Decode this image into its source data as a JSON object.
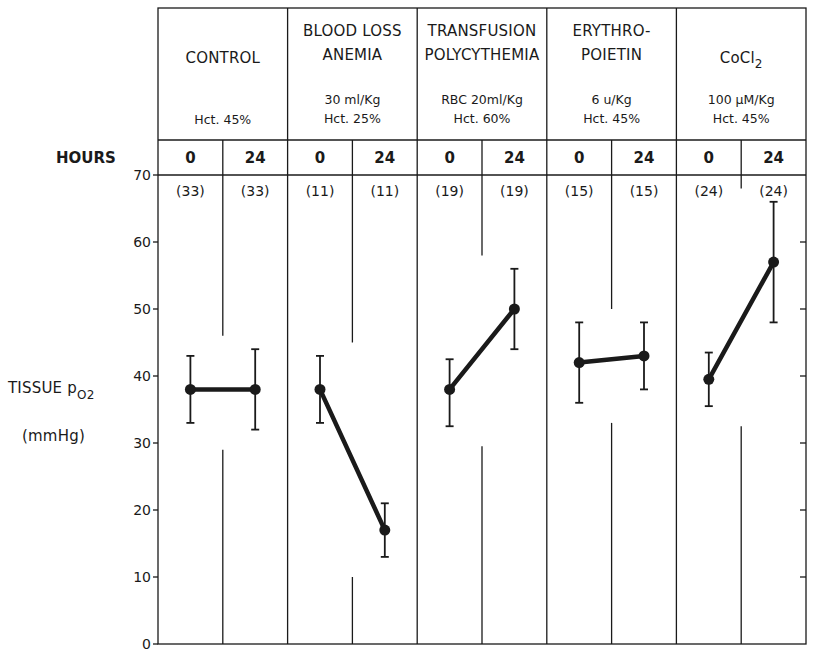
{
  "chart_data": {
    "type": "line",
    "title": "",
    "xlabel": "HOURS",
    "ylabel": "TISSUE pO2 (mmHg)",
    "ylabel_parts": {
      "main": "TISSUE p",
      "subscript": "O2",
      "unit": "(mmHg)"
    },
    "ylim": [
      0,
      70
    ],
    "yticks": [
      0,
      10,
      20,
      30,
      40,
      50,
      60,
      70
    ],
    "grid": false,
    "legend": "none",
    "hours_label": "HOURS",
    "groups": [
      {
        "name": "CONTROL",
        "name_lines": [
          "CONTROL"
        ],
        "detail_lines": [
          "Hct. 45%"
        ],
        "hours": [
          "0",
          "24"
        ],
        "n": [
          "(33)",
          "(33)"
        ],
        "mean": [
          38,
          38
        ],
        "err_low": [
          33,
          32
        ],
        "err_high": [
          43,
          44
        ]
      },
      {
        "name": "BLOOD LOSS ANEMIA",
        "name_lines": [
          "BLOOD LOSS",
          "ANEMIA"
        ],
        "detail_lines": [
          "30 ml/Kg",
          "Hct. 25%"
        ],
        "hours": [
          "0",
          "24"
        ],
        "n": [
          "(11)",
          "(11)"
        ],
        "mean": [
          38,
          17
        ],
        "err_low": [
          33,
          13
        ],
        "err_high": [
          43,
          21
        ]
      },
      {
        "name": "TRANSFUSION POLYCYTHEMIA",
        "name_lines": [
          "TRANSFUSION",
          "POLYCYTHEMIA"
        ],
        "detail_lines": [
          "RBC 20ml/Kg",
          "Hct. 60%"
        ],
        "hours": [
          "0",
          "24"
        ],
        "n": [
          "(19)",
          "(19)"
        ],
        "mean": [
          38,
          50
        ],
        "err_low": [
          32.5,
          44
        ],
        "err_high": [
          42.5,
          56
        ]
      },
      {
        "name": "ERYTHROPOIETIN",
        "name_lines": [
          "ERYTHRO-",
          "POIETIN"
        ],
        "detail_lines": [
          "6 u/Kg",
          "Hct. 45%"
        ],
        "hours": [
          "0",
          "24"
        ],
        "n": [
          "(15)",
          "(15)"
        ],
        "mean": [
          42,
          43
        ],
        "err_low": [
          36,
          38
        ],
        "err_high": [
          48,
          48
        ]
      },
      {
        "name": "CoCl2",
        "name_lines": [
          "CoCl2"
        ],
        "detail_lines": [
          "100 µM/Kg",
          "Hct. 45%"
        ],
        "hours": [
          "0",
          "24"
        ],
        "n": [
          "(24)",
          "(24)"
        ],
        "mean": [
          39.5,
          57
        ],
        "err_low": [
          35.5,
          48
        ],
        "err_high": [
          43.5,
          66
        ]
      }
    ]
  },
  "colors": {
    "ink": "#1a1a1a",
    "background": "#ffffff"
  }
}
